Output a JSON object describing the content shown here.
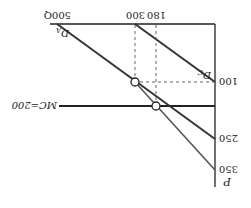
{
  "diagram": {
    "orientation": "rotated-180",
    "axes": {
      "y_label": "P",
      "x_label": "Q",
      "y_ticks": [
        "350",
        "250",
        "100"
      ],
      "x_ticks": [
        "180",
        "300",
        "500Q"
      ]
    },
    "lines": {
      "mc_label": "MC=200",
      "demand_a_label": "D",
      "demand_a_sub": "A",
      "demand_c_label": "D",
      "demand_c_sub": "C"
    },
    "points": [
      {
        "q": 300,
        "p": 100
      },
      {
        "q": 180,
        "p": 200
      }
    ],
    "colors": {
      "line": "#222222",
      "dashed": "#555555",
      "background": "#ffffff"
    }
  }
}
